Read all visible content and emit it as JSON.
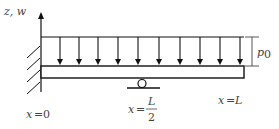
{
  "diagram": {
    "axis_label": "z, w",
    "load_label": "p",
    "load_subscript": "0",
    "labels": {
      "left": {
        "lhs": "x",
        "eq": "=",
        "rhs": "0"
      },
      "middle": {
        "lhs": "x",
        "eq": "=",
        "num": "L",
        "den": "2"
      },
      "right": {
        "lhs": "x",
        "eq": "=",
        "rhs": "L"
      }
    },
    "load_arrow_x": [
      60,
      79,
      98,
      118,
      138,
      159,
      180,
      200,
      220,
      240
    ],
    "colors": {
      "stroke": "#111111",
      "text": "#444444",
      "background": "#ffffff"
    }
  }
}
